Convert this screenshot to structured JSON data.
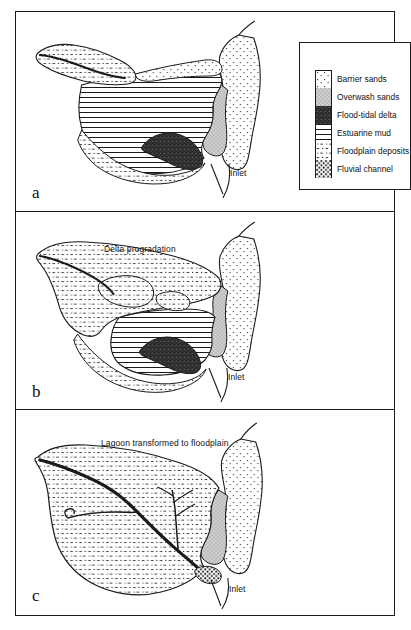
{
  "figure": {
    "legend": {
      "items": [
        {
          "key": "barrier-sands",
          "label": "Barrier sands",
          "pattern": "fine-sparse-dots",
          "color": "#ffffff"
        },
        {
          "key": "overwash-sands",
          "label": "Overwash sands",
          "pattern": "dense-fine-stipple",
          "color": "#d3d3d3"
        },
        {
          "key": "flood-tidal-delta",
          "label": "Flood-tidal delta",
          "pattern": "dark-speckle",
          "color": "#2e2e2e"
        },
        {
          "key": "estuarine-mud",
          "label": "Estuarine mud",
          "pattern": "horizontal-lines",
          "color": "#ffffff"
        },
        {
          "key": "floodplain-deposits",
          "label": "Floodplain deposits",
          "pattern": "dots-and-dashes",
          "color": "#ffffff"
        },
        {
          "key": "fluvial-channel",
          "label": "Fluvial channel",
          "pattern": "coarse-dense-dots",
          "color": "#ffffff"
        }
      ]
    },
    "panels": [
      {
        "id": "a",
        "label": "a",
        "annotations": [
          {
            "key": "inlet",
            "text": "Inlet",
            "x": 228,
            "y": 168
          }
        ]
      },
      {
        "id": "b",
        "label": "b",
        "annotations": [
          {
            "key": "delta-progradation",
            "text": "Delta progradation",
            "x": 103,
            "y": 232
          },
          {
            "key": "inlet",
            "text": "Inlet",
            "x": 228,
            "y": 365
          }
        ]
      },
      {
        "id": "c",
        "label": "c",
        "annotations": [
          {
            "key": "lagoon-transformed",
            "text": "Lagoon transformed to floodplain",
            "x": 100,
            "y": 430
          },
          {
            "key": "inlet",
            "text": "Inlet",
            "x": 229,
            "y": 578
          }
        ]
      }
    ]
  }
}
